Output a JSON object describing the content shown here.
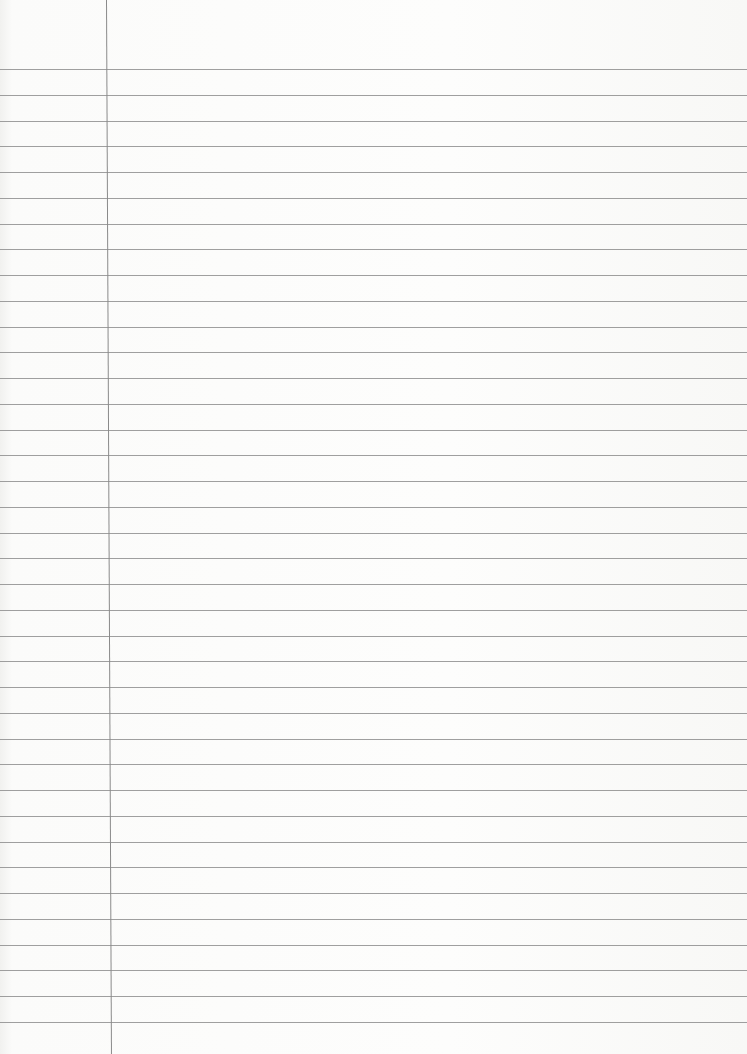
{
  "paper": {
    "type": "ruled-lined-paper",
    "background": "#fbfbfa",
    "line_color": "#8e8e8e",
    "margin_line_x": 106,
    "first_line_y": 69,
    "line_spacing": 25.75,
    "line_count": 38
  }
}
